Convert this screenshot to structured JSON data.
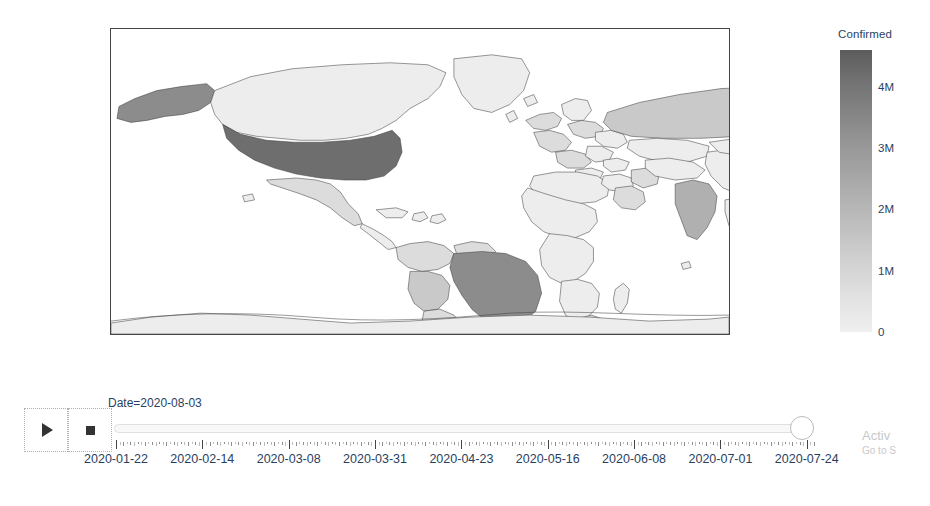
{
  "colorbar": {
    "title": "Confirmed",
    "ticks": [
      {
        "label": "4M",
        "value": 4000000
      },
      {
        "label": "3M",
        "value": 3000000
      },
      {
        "label": "2M",
        "value": 2000000
      },
      {
        "label": "1M",
        "value": 1000000
      },
      {
        "label": "0",
        "value": 0
      }
    ],
    "range": [
      0,
      4600000
    ],
    "low_color": "#efefef",
    "high_color": "#5c5c5c"
  },
  "controls": {
    "play_label": "▶",
    "pause_label": "■",
    "play_icon": "play-icon",
    "pause_icon": "stop-icon"
  },
  "slider": {
    "current_label": "Date=2020-08-03",
    "current_value": "2020-08-03",
    "position_percent": 100,
    "tick_labels": [
      "2020-01-22",
      "2020-02-14",
      "2020-03-08",
      "2020-03-31",
      "2020-04-23",
      "2020-05-16",
      "2020-06-08",
      "2020-07-01",
      "2020-07-24"
    ],
    "visible_tick_labels": [
      "2020-01-22",
      "2020-02-14",
      "2020-03-08",
      "2020-03-31",
      "2020-04-23",
      "2020-05-16",
      "2020-06-08",
      "2020-07-01",
      "2020-07-24"
    ],
    "total_steps": 195
  },
  "watermark": {
    "title": "Activ",
    "subtitle": "Go to S"
  },
  "chart_data": {
    "type": "choropleth",
    "title": "",
    "colorbar_title": "Confirmed",
    "frame": "2020-08-03",
    "projection": "equirectangular",
    "value_range": [
      0,
      4600000
    ],
    "colorscale": "Greys",
    "regions": [
      {
        "name": "United States",
        "shade": "very-dark",
        "value": 4600000
      },
      {
        "name": "Brazil",
        "shade": "dark",
        "value": 2750000
      },
      {
        "name": "India",
        "shade": "medium",
        "value": 1800000
      },
      {
        "name": "Russia",
        "shade": "light-med",
        "value": 860000
      },
      {
        "name": "Peru",
        "shade": "light-med",
        "value": 430000
      },
      {
        "name": "Mexico",
        "shade": "light",
        "value": 440000
      },
      {
        "name": "Chile",
        "shade": "light",
        "value": 360000
      },
      {
        "name": "South Africa",
        "shade": "light",
        "value": 516000
      },
      {
        "name": "Colombia",
        "shade": "light",
        "value": 317000
      },
      {
        "name": "Iran",
        "shade": "light",
        "value": 314000
      },
      {
        "name": "United Kingdom",
        "shade": "light",
        "value": 306000
      },
      {
        "name": "Spain",
        "shade": "light",
        "value": 296000
      },
      {
        "name": "Saudi Arabia",
        "shade": "light",
        "value": 280000
      },
      {
        "name": "Pakistan",
        "shade": "light",
        "value": 280000
      },
      {
        "name": "Others",
        "shade": "very-light",
        "value": 0
      }
    ]
  }
}
